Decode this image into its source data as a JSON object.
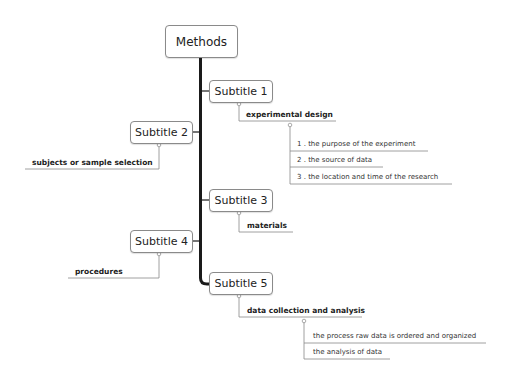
{
  "diagram": {
    "type": "mind-map",
    "root": {
      "label": "Methods"
    },
    "branches": [
      {
        "label": "Subtitle 1",
        "side": "right",
        "child": {
          "label": "experimental design",
          "items": [
            "1 . the purpose of the experiment",
            "2 . the source of data",
            "3 . the location and time of the research"
          ]
        }
      },
      {
        "label": "Subtitle 2",
        "side": "left",
        "child": {
          "label": "subjects or sample selection",
          "items": []
        }
      },
      {
        "label": "Subtitle 3",
        "side": "right",
        "child": {
          "label": "materials",
          "items": []
        }
      },
      {
        "label": "Subtitle 4",
        "side": "left",
        "child": {
          "label": "procedures",
          "items": []
        }
      },
      {
        "label": "Subtitle 5",
        "side": "right",
        "child": {
          "label": "data collection and analysis",
          "items": [
            "the process raw data is ordered and organized",
            "the analysis of data"
          ]
        }
      }
    ],
    "colors": {
      "spine": "#1a1a1a",
      "connector": "#888888",
      "node_border": "#8a8a8a"
    }
  }
}
